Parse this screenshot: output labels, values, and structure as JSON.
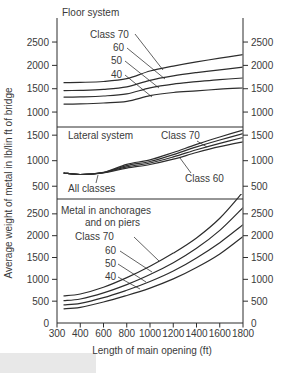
{
  "figure": {
    "x_axis_label": "Length of main opening (ft)",
    "y_axis_label": "Average weight of metal in lb/lin ft of bridge"
  },
  "chart_data": {
    "type": "line",
    "title": "",
    "xlabel": "Length of main opening (ft)",
    "ylabel": "Average weight of metal in lb/lin ft of bridge",
    "x_ticks": [
      300,
      400,
      600,
      800,
      1000,
      1200,
      1400,
      1600,
      1800
    ],
    "x_scale_note": "tick marks evenly spaced; first interval 100 ft, remaining intervals 200 ft",
    "grid": false,
    "line_color": "#2d2d2d",
    "text_color": "#3a3a3a",
    "background": "#ffffff",
    "scan_shade_color": "#e8e8e8",
    "tick_labels_both_sides": true,
    "panels": [
      {
        "id": "floor-system",
        "title": "Floor system",
        "y_ticks": [
          1000,
          1500,
          2000,
          2500
        ],
        "y_range": [
          680,
          3015
        ],
        "series": [
          {
            "name": "Class 70",
            "x": [
              330,
              400,
              600,
              800,
              1000,
              1200,
              1400,
              1600,
              1800
            ],
            "values": [
              1630,
              1635,
              1655,
              1715,
              1880,
              1985,
              2075,
              2155,
              2230
            ]
          },
          {
            "name": "Class 60",
            "x": [
              330,
              400,
              600,
              800,
              1000,
              1200,
              1400,
              1600,
              1800
            ],
            "values": [
              1460,
              1465,
              1485,
              1540,
              1680,
              1775,
              1845,
              1905,
              1960
            ]
          },
          {
            "name": "Class 50",
            "x": [
              330,
              400,
              600,
              800,
              1000,
              1200,
              1400,
              1600,
              1800
            ],
            "values": [
              1320,
              1325,
              1345,
              1390,
              1520,
              1600,
              1650,
              1695,
              1730
            ]
          },
          {
            "name": "Class 40",
            "x": [
              330,
              400,
              600,
              800,
              1000,
              1200,
              1400,
              1600,
              1800
            ],
            "values": [
              1170,
              1175,
              1195,
              1230,
              1350,
              1420,
              1455,
              1490,
              1515
            ]
          }
        ],
        "annotations": [
          {
            "text": "Floor system",
            "x": 62,
            "y": 16,
            "anchor": "start",
            "role": "panel-title"
          },
          {
            "text": "Class 70",
            "x": 90,
            "y": 38,
            "anchor": "start",
            "leader": [
              [
                135,
                34
              ],
              [
                163,
                70
              ]
            ]
          },
          {
            "text": "60",
            "x": 113,
            "y": 51,
            "anchor": "start",
            "leader": [
              [
                127,
                48
              ],
              [
                165,
                79
              ]
            ]
          },
          {
            "text": "50",
            "x": 111,
            "y": 64,
            "anchor": "start",
            "leader": [
              [
                125,
                61
              ],
              [
                159,
                88
              ]
            ]
          },
          {
            "text": "40",
            "x": 111,
            "y": 78,
            "anchor": "start",
            "leader": [
              [
                125,
                75
              ],
              [
                152,
                97
              ]
            ]
          }
        ]
      },
      {
        "id": "lateral-system",
        "title": "Lateral system",
        "y_ticks": [
          500,
          1000,
          1500
        ],
        "y_range": [
          250,
          1660
        ],
        "series": [
          {
            "name": "Class 70",
            "x": [
              330,
              400,
              600,
              800,
              1000,
              1200,
              1400,
              1600,
              1800
            ],
            "values": [
              760,
              730,
              770,
              930,
              1015,
              1160,
              1320,
              1465,
              1600
            ]
          },
          {
            "name": "Class 60",
            "x": [
              330,
              400,
              600,
              800,
              1000,
              1200,
              1400,
              1600,
              1800
            ],
            "values": [
              760,
              730,
              768,
              905,
              985,
              1120,
              1270,
              1405,
              1530
            ]
          },
          {
            "name": "Class 50",
            "x": [
              330,
              400,
              600,
              800,
              1000,
              1200,
              1400,
              1600,
              1800
            ],
            "values": [
              760,
              730,
              766,
              880,
              955,
              1075,
              1215,
              1340,
              1455
            ]
          },
          {
            "name": "Class 40",
            "x": [
              330,
              400,
              600,
              800,
              1000,
              1200,
              1400,
              1600,
              1800
            ],
            "values": [
              760,
              730,
              764,
              855,
              925,
              1030,
              1160,
              1275,
              1370
            ]
          }
        ],
        "annotations": [
          {
            "text": "Lateral system",
            "x": 68,
            "y": 139,
            "anchor": "start",
            "role": "panel-title"
          },
          {
            "text": "Class 70",
            "x": 161,
            "y": 139,
            "anchor": "start",
            "leader": [
              [
                197,
                141
              ],
              [
                207,
                147
              ]
            ]
          },
          {
            "text": "Class 60",
            "x": 185,
            "y": 182,
            "anchor": "start",
            "leader": [
              [
                191,
                173
              ],
              [
                180,
                158
              ]
            ]
          },
          {
            "text": "All classes",
            "x": 68,
            "y": 192,
            "anchor": "start",
            "leader": [
              [
                96,
                183
              ],
              [
                98,
                175
              ]
            ]
          }
        ]
      },
      {
        "id": "anchorages-and-piers",
        "title": "Metal in anchorages and on piers",
        "y_ticks": [
          0,
          500,
          1000,
          1500,
          2000,
          2500
        ],
        "y_range": [
          0,
          2840
        ],
        "series": [
          {
            "name": "Class 70",
            "x": [
              330,
              400,
              600,
              800,
              1000,
              1200,
              1400,
              1600,
              1800
            ],
            "values": [
              620,
              665,
              820,
              1040,
              1300,
              1600,
              1950,
              2400,
              3000
            ]
          },
          {
            "name": "Class 60",
            "x": [
              330,
              400,
              600,
              800,
              1000,
              1200,
              1400,
              1600,
              1800
            ],
            "values": [
              510,
              550,
              690,
              880,
              1110,
              1380,
              1710,
              2120,
              2640
            ]
          },
          {
            "name": "Class 50",
            "x": [
              330,
              400,
              600,
              800,
              1000,
              1200,
              1400,
              1600,
              1800
            ],
            "values": [
              415,
              450,
              580,
              750,
              950,
              1190,
              1490,
              1840,
              2250
            ]
          },
          {
            "name": "Class 40",
            "x": [
              330,
              400,
              600,
              800,
              1000,
              1200,
              1400,
              1600,
              1800
            ],
            "values": [
              325,
              360,
              480,
              630,
              800,
              1010,
              1270,
              1580,
              1980
            ]
          }
        ],
        "annotations": [
          {
            "text": "Metal in anchorages",
            "x": 61,
            "y": 214,
            "anchor": "start",
            "role": "panel-title"
          },
          {
            "text": "and on piers",
            "x": 85,
            "y": 226,
            "anchor": "start",
            "role": "panel-title"
          },
          {
            "text": "Class 70",
            "x": 75,
            "y": 240,
            "anchor": "start",
            "leader": [
              [
                134,
                237
              ],
              [
                159,
                261
              ]
            ]
          },
          {
            "text": "60",
            "x": 105,
            "y": 254,
            "anchor": "start",
            "leader": [
              [
                120,
                251
              ],
              [
                152,
                272
              ]
            ]
          },
          {
            "text": "50",
            "x": 105,
            "y": 267,
            "anchor": "start",
            "leader": [
              [
                118,
                264
              ],
              [
                146,
                282
              ]
            ]
          },
          {
            "text": "40",
            "x": 105,
            "y": 280,
            "anchor": "start",
            "leader": [
              [
                118,
                277
              ],
              [
                140,
                289
              ]
            ]
          }
        ]
      }
    ]
  }
}
